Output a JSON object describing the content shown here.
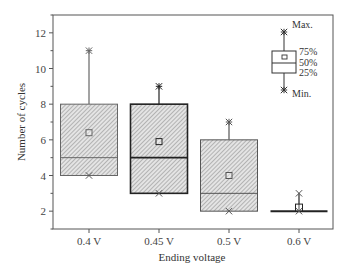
{
  "chart_data": {
    "type": "boxplot",
    "title": "",
    "xlabel": "Ending voltage",
    "ylabel": "Number of cycles",
    "ylim": [
      1,
      13
    ],
    "yticks": [
      2,
      4,
      6,
      8,
      10,
      12
    ],
    "categories": [
      "0.4 V",
      "0.45 V",
      "0.5 V",
      "0.6 V"
    ],
    "series": [
      {
        "category": "0.4 V",
        "min": 4,
        "q1": 4,
        "median": 5,
        "mean": 6.4,
        "q3": 8,
        "max": 11,
        "stroke": "#666666",
        "stroke_width": 1
      },
      {
        "category": "0.45 V",
        "min": 3,
        "q1": 3,
        "median": 5,
        "mean": 5.9,
        "q3": 8,
        "max": 9,
        "stroke": "#222222",
        "stroke_width": 1.6
      },
      {
        "category": "0.5 V",
        "min": 2,
        "q1": 2,
        "median": 3,
        "mean": 4.0,
        "q3": 6,
        "max": 7,
        "stroke": "#555555",
        "stroke_width": 1
      },
      {
        "category": "0.6 V",
        "min": 2,
        "q1": 2,
        "median": 2,
        "mean": 2.2,
        "q3": 2,
        "max": 3,
        "stroke": "#222222",
        "stroke_width": 1.6
      }
    ],
    "legend": {
      "position": "top-right",
      "labels": {
        "max": "Max.",
        "q3": "75%",
        "median": "50%",
        "q1": "25%",
        "min": "Min."
      }
    },
    "grid": false,
    "fill": "diagonal hatch (gray)"
  },
  "axes": {
    "x_title": "Ending voltage",
    "y_title": "Number of cycles"
  }
}
